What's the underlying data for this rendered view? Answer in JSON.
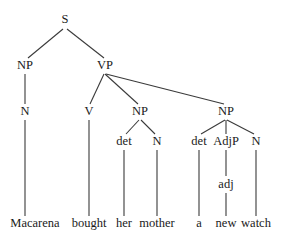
{
  "diagram": {
    "type": "syntax-tree",
    "sentence": "Macarena bought her mother a new watch",
    "nodes": [
      {
        "id": "S",
        "label": "S",
        "x": 65,
        "y": 20
      },
      {
        "id": "NP1",
        "label": "NP",
        "x": 25,
        "y": 66
      },
      {
        "id": "VP",
        "label": "VP",
        "x": 105,
        "y": 66
      },
      {
        "id": "N1",
        "label": "N",
        "x": 25,
        "y": 112
      },
      {
        "id": "V",
        "label": "V",
        "x": 89,
        "y": 112
      },
      {
        "id": "NP2",
        "label": "NP",
        "x": 140,
        "y": 112
      },
      {
        "id": "NP3",
        "label": "NP",
        "x": 226,
        "y": 112
      },
      {
        "id": "det1",
        "label": "det",
        "x": 124,
        "y": 142
      },
      {
        "id": "N2",
        "label": "N",
        "x": 157,
        "y": 142
      },
      {
        "id": "det2",
        "label": "det",
        "x": 199,
        "y": 142
      },
      {
        "id": "AdjP",
        "label": "AdjP",
        "x": 226,
        "y": 142
      },
      {
        "id": "N3",
        "label": "N",
        "x": 256,
        "y": 142
      },
      {
        "id": "adj",
        "label": "adj",
        "x": 226,
        "y": 185
      },
      {
        "id": "w1",
        "label": "Macarena",
        "x": 35,
        "y": 224
      },
      {
        "id": "w2",
        "label": "bought",
        "x": 89,
        "y": 224
      },
      {
        "id": "w3",
        "label": "her",
        "x": 124,
        "y": 224
      },
      {
        "id": "w4",
        "label": "mother",
        "x": 157,
        "y": 224
      },
      {
        "id": "w5",
        "label": "a",
        "x": 199,
        "y": 224
      },
      {
        "id": "w6",
        "label": "new",
        "x": 226,
        "y": 224
      },
      {
        "id": "w7",
        "label": "watch",
        "x": 256,
        "y": 224
      }
    ],
    "edges": [
      {
        "from": "S",
        "to": "NP1",
        "x1": 63,
        "y1": 29,
        "x2": 28,
        "y2": 58
      },
      {
        "from": "S",
        "to": "VP",
        "x1": 67,
        "y1": 29,
        "x2": 104,
        "y2": 58
      },
      {
        "from": "NP1",
        "to": "N1",
        "x1": 25,
        "y1": 74,
        "x2": 25,
        "y2": 104
      },
      {
        "from": "VP",
        "to": "V",
        "x1": 104,
        "y1": 74,
        "x2": 90,
        "y2": 104
      },
      {
        "from": "VP",
        "to": "NP2",
        "x1": 105,
        "y1": 74,
        "x2": 138,
        "y2": 104
      },
      {
        "from": "VP",
        "to": "NP3",
        "x1": 106,
        "y1": 74,
        "x2": 224,
        "y2": 104
      },
      {
        "from": "N1",
        "to": "w1",
        "x1": 25,
        "y1": 120,
        "x2": 25,
        "y2": 216
      },
      {
        "from": "V",
        "to": "w2",
        "x1": 89,
        "y1": 120,
        "x2": 89,
        "y2": 216
      },
      {
        "from": "NP2",
        "to": "det1",
        "x1": 139,
        "y1": 120,
        "x2": 126,
        "y2": 134
      },
      {
        "from": "NP2",
        "to": "N2",
        "x1": 141,
        "y1": 120,
        "x2": 155,
        "y2": 134
      },
      {
        "from": "NP3",
        "to": "det2",
        "x1": 225,
        "y1": 120,
        "x2": 201,
        "y2": 134
      },
      {
        "from": "NP3",
        "to": "AdjP",
        "x1": 226,
        "y1": 120,
        "x2": 226,
        "y2": 134
      },
      {
        "from": "NP3",
        "to": "N3",
        "x1": 227,
        "y1": 120,
        "x2": 254,
        "y2": 134
      },
      {
        "from": "det1",
        "to": "w3",
        "x1": 124,
        "y1": 150,
        "x2": 124,
        "y2": 216
      },
      {
        "from": "N2",
        "to": "w4",
        "x1": 157,
        "y1": 150,
        "x2": 157,
        "y2": 216
      },
      {
        "from": "det2",
        "to": "w5",
        "x1": 199,
        "y1": 150,
        "x2": 199,
        "y2": 216
      },
      {
        "from": "AdjP",
        "to": "adj",
        "x1": 226,
        "y1": 150,
        "x2": 226,
        "y2": 176
      },
      {
        "from": "N3",
        "to": "w7",
        "x1": 256,
        "y1": 150,
        "x2": 256,
        "y2": 216
      },
      {
        "from": "adj",
        "to": "w6",
        "x1": 226,
        "y1": 193,
        "x2": 226,
        "y2": 216
      }
    ]
  }
}
